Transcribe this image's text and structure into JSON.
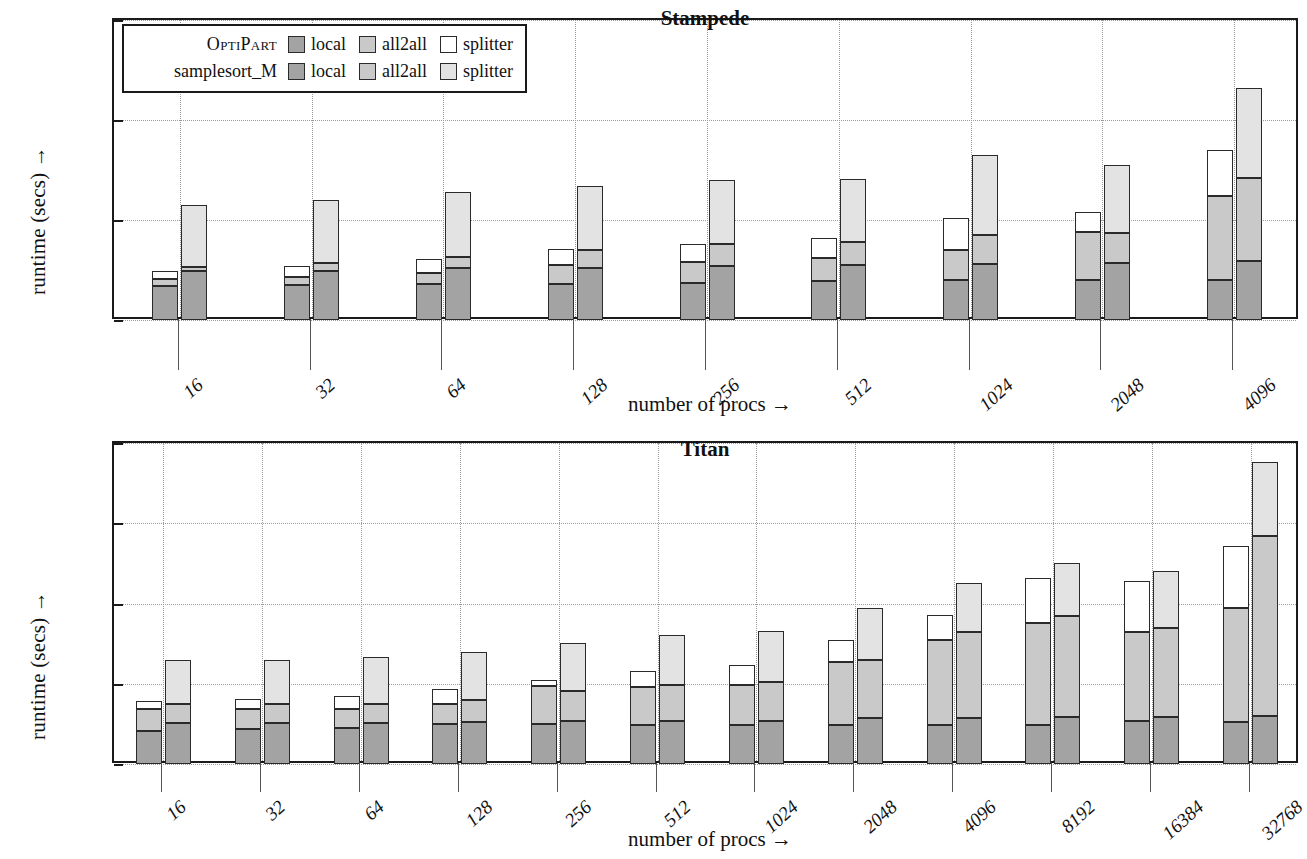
{
  "figure": {
    "axis_labels": {
      "y": "runtime (secs) →",
      "x": "number of procs →"
    }
  },
  "legend": {
    "rows": [
      {
        "name": "OptiPart",
        "style": "smallcaps",
        "entries": [
          {
            "label": "local",
            "swatch": "fill-local-a"
          },
          {
            "label": "all2all",
            "swatch": "fill-all2all-a"
          },
          {
            "label": "splitter",
            "swatch": "fill-split-a"
          }
        ]
      },
      {
        "name": "samplesort_M",
        "style": "normal",
        "entries": [
          {
            "label": "local",
            "swatch": "fill-local-b"
          },
          {
            "label": "all2all",
            "swatch": "fill-all2all-b"
          },
          {
            "label": "splitter",
            "swatch": "fill-split-b"
          }
        ]
      }
    ]
  },
  "chart_data": [
    {
      "type": "bar",
      "subtype": "grouped-stacked",
      "title": "Stampede",
      "xlabel": "number of procs →",
      "ylabel": "runtime (secs) →",
      "ylim": [
        0,
        1.5
      ],
      "yticks": [
        0,
        0.5,
        1,
        1.5
      ],
      "ytick_labels": [
        "0",
        "0.5",
        "1",
        "1.5"
      ],
      "grid": true,
      "categories": [
        "16",
        "32",
        "64",
        "128",
        "256",
        "512",
        "1024",
        "2048",
        "4096"
      ],
      "groups": [
        {
          "name": "OptiPart",
          "stack_order": [
            "local",
            "all2all",
            "splitter"
          ],
          "series": [
            {
              "name": "local",
              "values": [
                0.17,
                0.175,
                0.18,
                0.18,
                0.185,
                0.195,
                0.2,
                0.2,
                0.2
              ]
            },
            {
              "name": "all2all",
              "values": [
                0.035,
                0.04,
                0.055,
                0.095,
                0.105,
                0.115,
                0.15,
                0.24,
                0.42
              ]
            },
            {
              "name": "splitter",
              "values": [
                0.04,
                0.055,
                0.07,
                0.08,
                0.09,
                0.1,
                0.16,
                0.1,
                0.23
              ]
            }
          ],
          "totals": [
            0.245,
            0.27,
            0.305,
            0.355,
            0.38,
            0.41,
            0.51,
            0.54,
            0.85
          ]
        },
        {
          "name": "samplesort_M",
          "stack_order": [
            "local",
            "all2all",
            "splitter"
          ],
          "series": [
            {
              "name": "local",
              "values": [
                0.245,
                0.245,
                0.26,
                0.26,
                0.27,
                0.275,
                0.28,
                0.285,
                0.295
              ]
            },
            {
              "name": "all2all",
              "values": [
                0.02,
                0.04,
                0.055,
                0.09,
                0.11,
                0.115,
                0.145,
                0.15,
                0.415
              ]
            },
            {
              "name": "splitter",
              "values": [
                0.31,
                0.315,
                0.325,
                0.32,
                0.32,
                0.315,
                0.4,
                0.34,
                0.45
              ]
            }
          ],
          "totals": [
            0.575,
            0.6,
            0.64,
            0.67,
            0.7,
            0.705,
            0.825,
            0.775,
            1.16
          ]
        }
      ]
    },
    {
      "type": "bar",
      "subtype": "grouped-stacked",
      "title": "Titan",
      "xlabel": "number of procs →",
      "ylabel": "runtime (secs) →",
      "ylim": [
        0,
        20
      ],
      "yticks": [
        0,
        5,
        10,
        15,
        20
      ],
      "ytick_labels": [
        "0",
        "5",
        "10",
        "15",
        "20"
      ],
      "grid": true,
      "categories": [
        "16",
        "32",
        "64",
        "128",
        "256",
        "512",
        "1024",
        "2048",
        "4096",
        "8192",
        "16384",
        "32768"
      ],
      "groups": [
        {
          "name": "OptiPart",
          "stack_order": [
            "local",
            "all2all",
            "splitter"
          ],
          "series": [
            {
              "name": "local",
              "values": [
                2.05,
                2.2,
                2.25,
                2.5,
                2.5,
                2.45,
                2.4,
                2.4,
                2.4,
                2.45,
                2.65,
                2.6
              ]
            },
            {
              "name": "all2all",
              "values": [
                1.35,
                1.25,
                1.2,
                1.25,
                2.35,
                2.35,
                2.5,
                3.95,
                5.35,
                6.35,
                5.6,
                7.1
              ]
            },
            {
              "name": "splitter",
              "values": [
                0.55,
                0.6,
                0.8,
                0.95,
                0.4,
                1.0,
                1.25,
                1.4,
                1.55,
                2.8,
                3.15,
                3.9
              ]
            }
          ],
          "totals": [
            3.95,
            4.05,
            4.25,
            4.7,
            5.25,
            5.8,
            6.15,
            7.75,
            9.3,
            11.6,
            11.4,
            13.6
          ]
        },
        {
          "name": "samplesort_M",
          "stack_order": [
            "local",
            "all2all",
            "splitter"
          ],
          "series": [
            {
              "name": "local",
              "values": [
                2.55,
                2.55,
                2.55,
                2.6,
                2.65,
                2.7,
                2.7,
                2.85,
                2.85,
                2.9,
                2.95,
                3.0
              ]
            },
            {
              "name": "all2all",
              "values": [
                1.2,
                1.2,
                1.2,
                1.4,
                1.9,
                2.25,
                2.4,
                3.65,
                5.35,
                6.3,
                5.55,
                11.2
              ]
            },
            {
              "name": "splitter",
              "values": [
                2.75,
                2.7,
                2.9,
                2.95,
                3.0,
                3.1,
                3.2,
                3.2,
                3.05,
                3.3,
                3.55,
                4.6
              ]
            }
          ],
          "totals": [
            6.5,
            6.45,
            6.65,
            6.95,
            7.55,
            8.05,
            8.3,
            9.7,
            11.25,
            12.5,
            12.05,
            18.8
          ]
        }
      ]
    }
  ]
}
